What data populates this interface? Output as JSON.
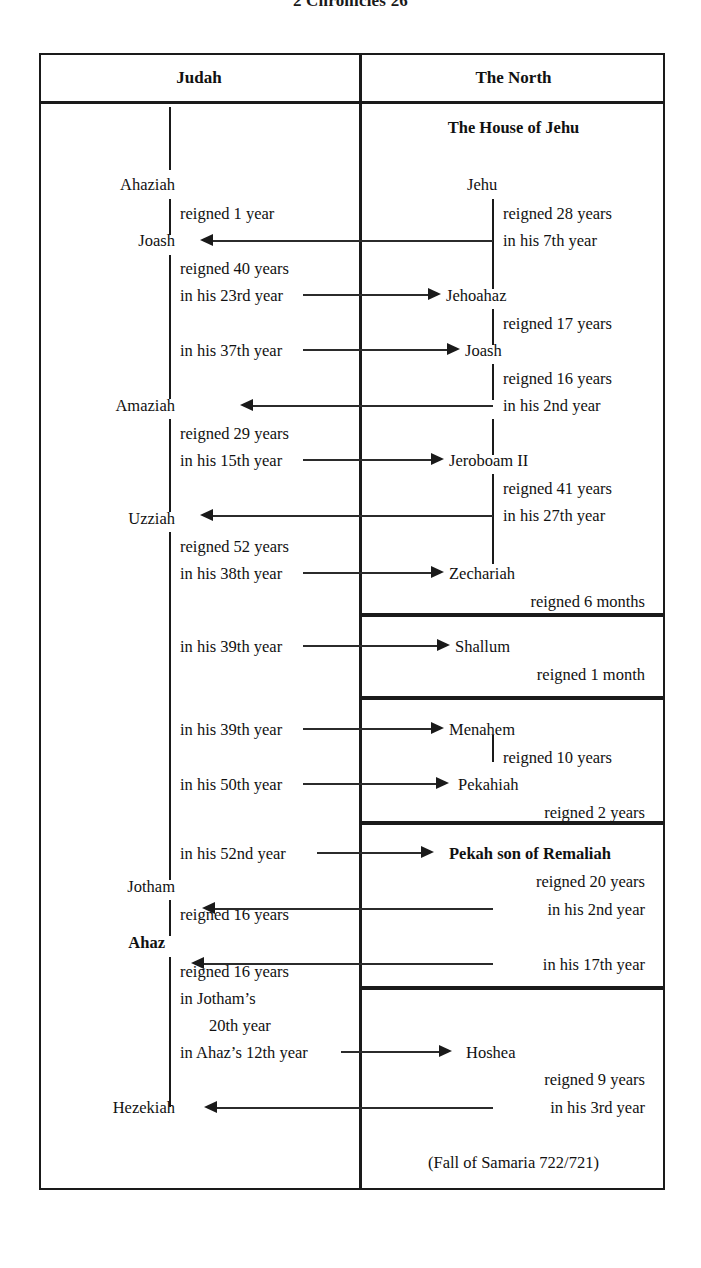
{
  "title": "2 Chronicles 26",
  "columns": {
    "left": "Judah",
    "right": "The North"
  },
  "north_section_heading": "The House of Jehu",
  "footnote": "(Fall of Samaria 722/721)",
  "judah": {
    "k1_name": "Ahaziah",
    "k1_reign": "reigned 1 year",
    "k2_name": "Joash",
    "k2_reign": "reigned 40 years",
    "k2_sync1": "in his 23rd year",
    "k2_sync2": "in his 37th year",
    "k3_name": "Amaziah",
    "k3_reign": "reigned 29 years",
    "k3_sync1": "in his 15th year",
    "k4_name": "Uzziah",
    "k4_reign": "reigned 52 years",
    "k4_sync1": "in his 38th year",
    "k4_sync2": "in his 39th year",
    "k4_sync3": "in his 39th year",
    "k4_sync4": "in his 50th year",
    "k4_sync5": "in his 52nd year",
    "k5_name": "Jotham",
    "k5_reign": "reigned 16 years",
    "k6_name": "Ahaz",
    "k6_reign": "reigned 16 years",
    "k6_sync_a": "in Jotham’s",
    "k6_sync_b": "20th year",
    "k6_sync_c": "in Ahaz’s 12th year",
    "k7_name": "Hezekiah"
  },
  "north": {
    "n1_name": "Jehu",
    "n1_reign": "reigned 28 years",
    "n1_sync": "in his 7th year",
    "n2_name": "Jehoahaz",
    "n2_reign": "reigned 17 years",
    "n3_name": "Joash",
    "n3_reign": "reigned 16 years",
    "n3_sync": "in his 2nd year",
    "n4_name": "Jeroboam II",
    "n4_reign": "reigned 41 years",
    "n4_sync": "in his 27th year",
    "n5_name": "Zechariah",
    "n5_reign": "reigned 6 months",
    "n6_name": "Shallum",
    "n6_reign": "reigned 1 month",
    "n7_name": "Menahem",
    "n7_reign": "reigned 10 years",
    "n8_name": "Pekahiah",
    "n8_reign": "reigned 2 years",
    "n9_name": "Pekah son of Remaliah",
    "n9_reign": "reigned 20 years",
    "n9_sync1": "in his 2nd year",
    "n9_sync2": "in his 17th year",
    "n10_name": "Hoshea",
    "n10_reign": "reigned 9 years",
    "n10_sync": "in his 3rd year"
  }
}
